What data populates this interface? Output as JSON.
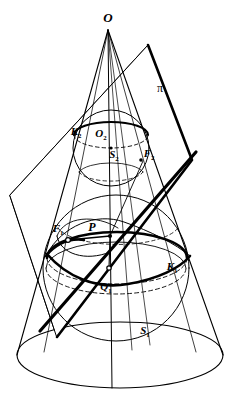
{
  "figure": {
    "background_color": "#ffffff",
    "ink_color": "#000000",
    "width": 245,
    "height": 408
  },
  "labels": {
    "apex": {
      "text": "O",
      "x": 108,
      "y": 22
    },
    "plane": {
      "text": "π",
      "x": 160,
      "y": 92
    },
    "circle_upper": {
      "text": "K",
      "sub": "2",
      "x": 76,
      "y": 135
    },
    "center_upper": {
      "text": "O",
      "sub": "2",
      "x": 101,
      "y": 137
    },
    "sphere_upper": {
      "text": "S",
      "sub": "2",
      "x": 114,
      "y": 158
    },
    "focus_upper": {
      "text": "F",
      "sub": "2",
      "x": 147,
      "y": 157
    },
    "focus_lower": {
      "text": "F",
      "sub": "1",
      "x": 58,
      "y": 232
    },
    "point_p": {
      "text": "P",
      "x": 92,
      "y": 231
    },
    "circle_lower": {
      "text": "K",
      "sub": "1",
      "x": 172,
      "y": 270
    },
    "point_q": {
      "text": "Q",
      "sub": "1",
      "x": 106,
      "y": 290
    },
    "sphere_lower": {
      "text": "S",
      "sub": "1",
      "x": 145,
      "y": 334
    }
  },
  "geometry": {
    "cone": {
      "apex": [
        108,
        30
      ],
      "base_center": [
        120,
        355
      ],
      "base_rx": 103,
      "base_ry": 33,
      "left_generator": "M108,30 L17,355",
      "right_generator": "M108,30 L223,355"
    },
    "axis": {
      "from": [
        108,
        30
      ],
      "to": [
        112,
        388
      ]
    },
    "sphere_upper": {
      "cx": 111,
      "cy": 148,
      "r": 38
    },
    "sphere_lower": {
      "cx": 116,
      "cy": 268,
      "r": 73
    },
    "contact_circle_upper": {
      "cx": 111,
      "cy": 135,
      "rx": 37,
      "ry": 13
    },
    "contact_circle_lower": {
      "cx": 117,
      "cy": 258,
      "rx": 70,
      "ry": 26
    },
    "cutting_plane_polygon": "10,195 148,45 192,160 57,337",
    "cut_line": {
      "from": [
        40,
        331
      ],
      "to": [
        196,
        152
      ]
    },
    "conic_section": "ellipse through P and tangency points",
    "markers": {
      "F1": [
        68,
        240
      ],
      "P": [
        110,
        236
      ],
      "Q1": [
        109,
        268
      ],
      "F2": [
        143,
        161
      ]
    }
  }
}
